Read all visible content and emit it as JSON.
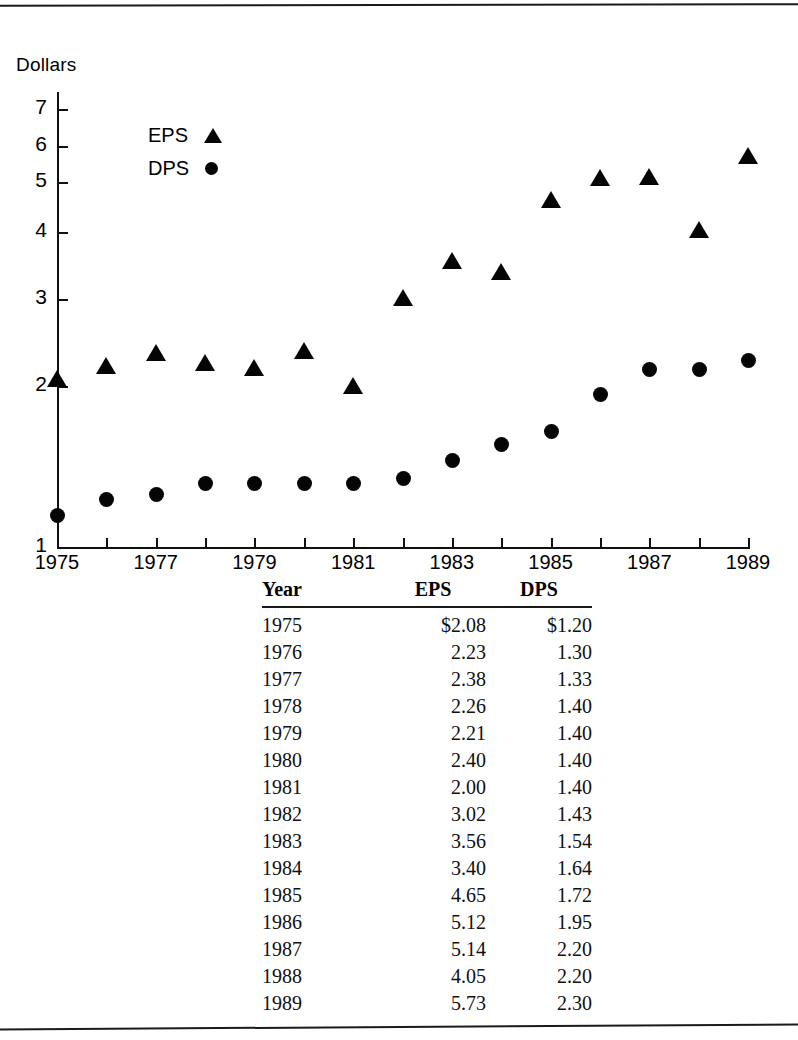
{
  "figure": {
    "y_axis_title": "Dollars",
    "legend": [
      {
        "label": "EPS",
        "marker": "triangle-marker"
      },
      {
        "label": "DPS",
        "marker": "circle-marker"
      }
    ],
    "y_ticks": [
      "1",
      "2",
      "3",
      "4",
      "5",
      "6",
      "7"
    ],
    "x_ticks": [
      "1975",
      "1977",
      "1979",
      "1981",
      "1983",
      "1985",
      "1987",
      "1989"
    ]
  },
  "table": {
    "headers": [
      "Year",
      "EPS",
      "DPS"
    ],
    "rows": [
      [
        "1975",
        "$2.08",
        "$1.20"
      ],
      [
        "1976",
        "2.23",
        "1.30"
      ],
      [
        "1977",
        "2.38",
        "1.33"
      ],
      [
        "1978",
        "2.26",
        "1.40"
      ],
      [
        "1979",
        "2.21",
        "1.40"
      ],
      [
        "1980",
        "2.40",
        "1.40"
      ],
      [
        "1981",
        "2.00",
        "1.40"
      ],
      [
        "1982",
        "3.02",
        "1.43"
      ],
      [
        "1983",
        "3.56",
        "1.54"
      ],
      [
        "1984",
        "3.40",
        "1.64"
      ],
      [
        "1985",
        "4.65",
        "1.72"
      ],
      [
        "1986",
        "5.12",
        "1.95"
      ],
      [
        "1987",
        "5.14",
        "2.20"
      ],
      [
        "1988",
        "4.05",
        "2.20"
      ],
      [
        "1989",
        "5.73",
        "2.30"
      ]
    ]
  },
  "chart_data": {
    "type": "scatter",
    "title": "",
    "xlabel": "",
    "ylabel": "Dollars",
    "x": [
      1975,
      1976,
      1977,
      1978,
      1979,
      1980,
      1981,
      1982,
      1983,
      1984,
      1985,
      1986,
      1987,
      1988,
      1989
    ],
    "xlim": [
      1975,
      1989
    ],
    "ylim": [
      1,
      7
    ],
    "yticks": [
      1,
      2,
      3,
      4,
      5,
      6,
      7
    ],
    "xticks": [
      1975,
      1977,
      1979,
      1981,
      1983,
      1985,
      1987,
      1989
    ],
    "grid": false,
    "legend_position": "upper-left-inside",
    "series": [
      {
        "name": "EPS",
        "marker": "triangle",
        "color": "#050505",
        "values": [
          2.08,
          2.23,
          2.38,
          2.26,
          2.21,
          2.4,
          2.0,
          3.02,
          3.56,
          3.4,
          4.65,
          5.12,
          5.14,
          4.05,
          5.73
        ]
      },
      {
        "name": "DPS",
        "marker": "circle",
        "color": "#050505",
        "values": [
          1.2,
          1.3,
          1.33,
          1.4,
          1.4,
          1.4,
          1.4,
          1.43,
          1.54,
          1.64,
          1.72,
          1.95,
          2.2,
          2.2,
          2.3
        ]
      }
    ]
  }
}
